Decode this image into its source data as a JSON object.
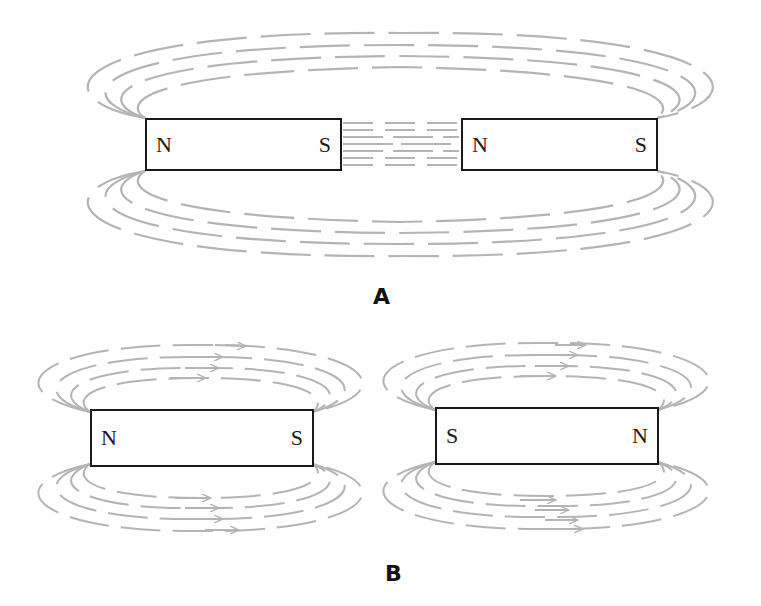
{
  "colors": {
    "field_line": "#b4b4b4",
    "magnet_border": "#1a1a1a",
    "label": "#111111"
  },
  "panels": [
    {
      "label": "A",
      "description": "Opposite poles facing (S of left magnet faces N of right magnet): attracting",
      "magnets": [
        {
          "left_pole": "N",
          "right_pole": "S"
        },
        {
          "left_pole": "N",
          "right_pole": "S"
        }
      ]
    },
    {
      "label": "B",
      "description": "Like poles facing away (S faces S): separate field loops with arrows",
      "magnets": [
        {
          "left_pole": "N",
          "right_pole": "S"
        },
        {
          "left_pole": "S",
          "right_pole": "N"
        }
      ]
    }
  ]
}
